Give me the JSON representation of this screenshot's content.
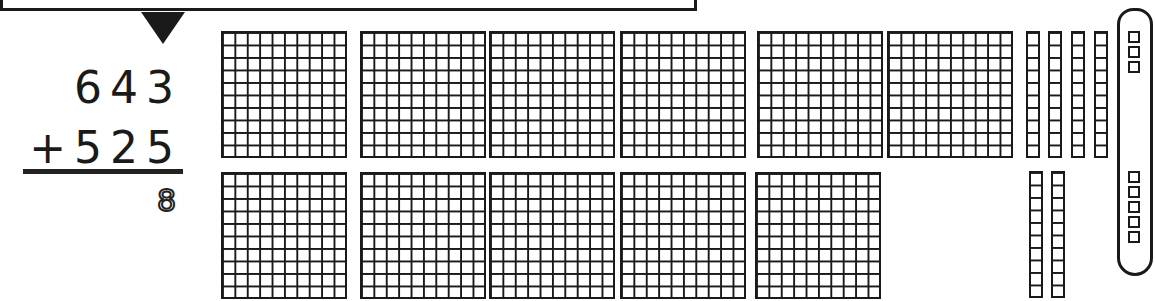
{
  "problem": {
    "addend1": "643",
    "addend2": "+525",
    "partial_answer_ones": "8",
    "operation": "addition"
  },
  "base_ten_blocks": {
    "hundreds_flats": {
      "top_row_count": 6,
      "bottom_row_count": 5,
      "total": 11,
      "top_row_x": [
        221,
        360,
        489,
        620,
        757,
        887
      ],
      "bottom_row_x": [
        221,
        360,
        489,
        620,
        755
      ],
      "top_row_y": 31,
      "bottom_row_y": 172
    },
    "tens_rods": {
      "top_row_count": 4,
      "bottom_row_count": 2,
      "total": 6,
      "top_row_x": [
        1026,
        1048,
        1071,
        1094
      ],
      "bottom_row_x": [
        1029,
        1051
      ],
      "top_row_y": 31,
      "bottom_row_y": 171
    },
    "ones_units": {
      "top_group_count": 3,
      "bottom_group_count": 5,
      "total": 8,
      "circled": true,
      "top_group_y": [
        31,
        46,
        61
      ],
      "bottom_group_y": [
        171,
        186,
        201,
        216,
        231
      ]
    }
  },
  "colors": {
    "ink": "#1a1a1a",
    "background": "#ffffff"
  }
}
